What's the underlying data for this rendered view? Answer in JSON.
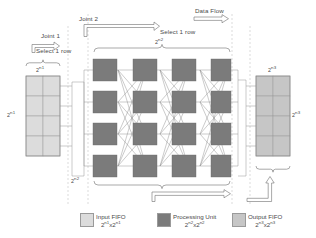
{
  "figure": {
    "type": "architecture-block-diagram"
  },
  "colors": {
    "input_fifo_fill": "#dcdcdc",
    "processing_unit_fill": "#7b7b7b",
    "output_fifo_fill": "#c6c6c6",
    "line": "#6e6e6e",
    "text": "#4a4a4a",
    "background": "#ffffff",
    "dashed_guide": "#c0c0c0"
  },
  "annotations": {
    "joint1": "Joint 1",
    "joint2": "Joint 2",
    "select_row_left": "Select 1 row",
    "select_row_top": "Select 1 row",
    "data_flow": "Data Flow"
  },
  "dimension_labels": {
    "input_fifo_width": {
      "base": "2",
      "exp": "n1"
    },
    "input_fifo_height": {
      "base": "2",
      "exp": "n1"
    },
    "pe_array_width": {
      "base": "2",
      "exp": "n2"
    },
    "pe_array_height": {
      "base": "2",
      "exp": "n2"
    },
    "output_fifo_width": {
      "base": "2",
      "exp": "n3"
    },
    "output_fifo_height": {
      "base": "2",
      "exp": "n3"
    }
  },
  "blocks": {
    "input_fifo": {
      "name": "Input FIFO",
      "rows": 4,
      "cols": 2
    },
    "pe_array": {
      "name": "Processing Unit array",
      "rows": 4,
      "cols": 4
    },
    "output_fifo": {
      "name": "Output FIFO",
      "rows": 4,
      "cols": 2
    }
  },
  "legend": [
    {
      "label": "Input FIFO",
      "dims": "2^n1 x 2^n1",
      "base": "2",
      "exp": "n1",
      "swatch": "#dcdcdc"
    },
    {
      "label": "Processing Unit",
      "dims": "2^n2 x 2^n2",
      "base": "2",
      "exp": "n2",
      "swatch": "#7b7b7b"
    },
    {
      "label": "Output FIFO",
      "dims": "2^n3 x 2^n3",
      "base": "2",
      "exp": "n3",
      "swatch": "#c6c6c6"
    }
  ]
}
